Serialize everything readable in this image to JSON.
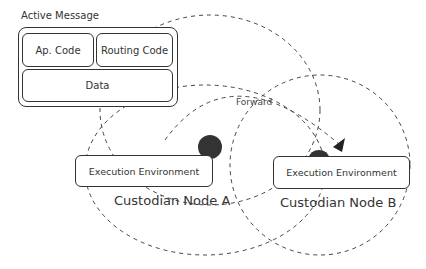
{
  "diagram": {
    "active_message": {
      "title": "Active Message",
      "fields": {
        "ap_code": "Ap. Code",
        "routing_code": "Routing Code",
        "data": "Data"
      }
    },
    "edge_label": "Forward",
    "nodes": [
      {
        "id": "A",
        "env_label": "Execution Environment",
        "name": "Custodian Node A"
      },
      {
        "id": "B",
        "env_label": "Execution Environment",
        "name": "Custodian Node B"
      }
    ],
    "colors": {
      "stroke": "#333333",
      "dot": "#333333",
      "background": "#ffffff"
    }
  }
}
